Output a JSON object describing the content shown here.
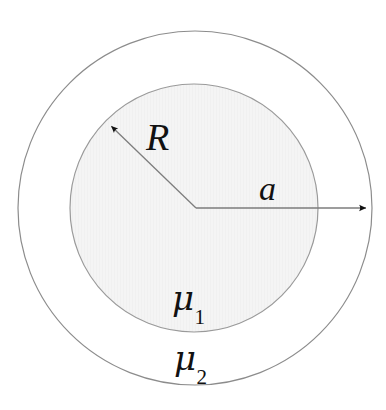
{
  "figure": {
    "background_color": "#ffffff",
    "width": 386,
    "height": 410
  },
  "geometry": {
    "center": {
      "x": 195,
      "y": 208
    },
    "outer_circle": {
      "name": "outer-boundary-circle",
      "radius": 177,
      "stroke_color": "#8c8c8c",
      "stroke_width": 1.2,
      "fill_color": "#ffffff"
    },
    "inner_circle": {
      "name": "inner-region-circle",
      "radius": 124,
      "stroke_color": "#9a9a9a",
      "stroke_width": 1.2,
      "fill_color": "#f4f4f4"
    }
  },
  "arrows": {
    "radius_R": {
      "label": "R",
      "from": {
        "x": 196,
        "y": 208
      },
      "to": {
        "x": 107,
        "y": 122
      },
      "stroke_color": "#7d7d7d",
      "head_color": "#111111",
      "description": "radius arrow from center to inner circle, up-left"
    },
    "radius_a": {
      "label": "a",
      "from": {
        "x": 196,
        "y": 208
      },
      "to": {
        "x": 372,
        "y": 208
      },
      "stroke_color": "#7d7d7d",
      "head_color": "#111111",
      "description": "radius arrow from center to outer circle, horizontal right"
    }
  },
  "labels": {
    "R": {
      "text": "R",
      "x": 163,
      "y": 138
    },
    "a": {
      "text": "a",
      "x": 272,
      "y": 190
    },
    "mu1": {
      "glyph": "μ",
      "subscript": "1",
      "x": 193,
      "y": 300
    },
    "mu2": {
      "glyph": "μ",
      "subscript": "2",
      "x": 196,
      "y": 360
    }
  },
  "chart_data": {
    "type": "diagram",
    "elements": [
      {
        "name": "inner-disk",
        "shape": "circle",
        "radius_symbol": "R",
        "radius_px": 124,
        "material_label": "μ1",
        "fill": "#f4f4f4"
      },
      {
        "name": "outer-annulus",
        "shape": "annulus",
        "radius_symbol": "a",
        "radius_px": 177,
        "material_label": "μ2",
        "fill": "#ffffff"
      }
    ],
    "annotations": [
      "R",
      "a",
      "μ1",
      "μ2"
    ]
  }
}
